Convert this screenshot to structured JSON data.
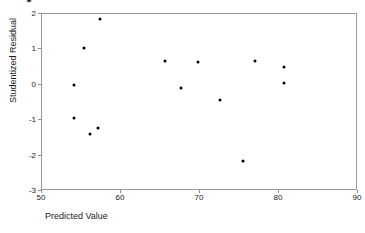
{
  "chart_data": {
    "type": "scatter",
    "title": "",
    "xlabel": "Predicted Value",
    "ylabel": "Studentized Residual",
    "xlim": [
      50,
      90
    ],
    "ylim": [
      -3,
      2
    ],
    "xticks": [
      "50",
      "60",
      "70",
      "80",
      "90"
    ],
    "yticks": [
      "2",
      "1",
      "0",
      "-1",
      "-2",
      "-3"
    ],
    "grid": false,
    "legend": null,
    "marker_color": "#000000",
    "frame_color": "#9a9a9a",
    "points": [
      {
        "x": 54.2,
        "y": -0.03
      },
      {
        "x": 54.2,
        "y": -0.96
      },
      {
        "x": 55.4,
        "y": 1.0
      },
      {
        "x": 56.2,
        "y": -1.42
      },
      {
        "x": 57.2,
        "y": -1.25
      },
      {
        "x": 57.5,
        "y": 1.83
      },
      {
        "x": 65.7,
        "y": 0.64
      },
      {
        "x": 67.7,
        "y": -0.12
      },
      {
        "x": 69.9,
        "y": 0.62
      },
      {
        "x": 72.7,
        "y": -0.46
      },
      {
        "x": 75.6,
        "y": -2.18
      },
      {
        "x": 77.1,
        "y": 0.64
      },
      {
        "x": 80.8,
        "y": 0.47
      },
      {
        "x": 80.8,
        "y": 0.02
      }
    ]
  }
}
